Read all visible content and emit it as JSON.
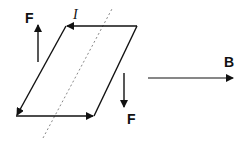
{
  "diagram": {
    "colors": {
      "line": "#111111",
      "dashed_axis": "#888888",
      "background": "#ffffff"
    },
    "loop": {
      "shape": "parallelogram",
      "current_label": "I",
      "corners": {
        "top_left": [
          66,
          26
        ],
        "top_right": [
          137,
          26
        ],
        "bottom_right": [
          94,
          116
        ],
        "bottom_left": [
          16,
          116
        ]
      },
      "current_direction": "counter-clockwise as drawn (top edge right-to-left, left edge top-to-bottom, bottom edge left-to-right)"
    },
    "axis": {
      "style": "dashed",
      "from": [
        43,
        138
      ],
      "to": [
        113,
        7
      ]
    },
    "forces": [
      {
        "label": "F",
        "direction": "up",
        "from": [
          38,
          62
        ],
        "to": [
          38,
          24
        ],
        "label_pos": [
          25,
          22
        ]
      },
      {
        "label": "F",
        "direction": "down",
        "from": [
          124,
          73
        ],
        "to": [
          124,
          108
        ],
        "label_pos": [
          126,
          124
        ]
      }
    ],
    "field": {
      "label": "B",
      "direction": "right",
      "from": [
        148,
        78
      ],
      "to": [
        234,
        78
      ],
      "label_pos": [
        225,
        66
      ]
    }
  }
}
